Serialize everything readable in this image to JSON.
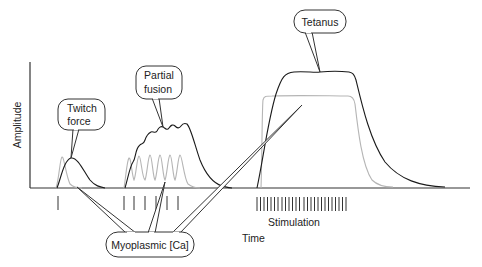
{
  "diagram": {
    "axes": {
      "y_label": "Amplitude",
      "x_label": "Time"
    },
    "callouts": {
      "twitch": {
        "line1": "Twitch",
        "line2": "force"
      },
      "partial": {
        "line1": "Partial",
        "line2": "fusion"
      },
      "tetanus": {
        "label": "Tetanus"
      },
      "calcium": {
        "label": "Myoplasmic [Ca]"
      }
    },
    "stimulation_label": "Stimulation",
    "stimulus_groups": [
      {
        "name": "twitch",
        "pulses": 1
      },
      {
        "name": "partial-fusion",
        "pulses": 6
      },
      {
        "name": "tetanus",
        "pulses": 28
      }
    ],
    "colors": {
      "force_trace": "#1a1a1a",
      "calcium_trace": "#b5b5b5",
      "axis": "#333333"
    }
  }
}
